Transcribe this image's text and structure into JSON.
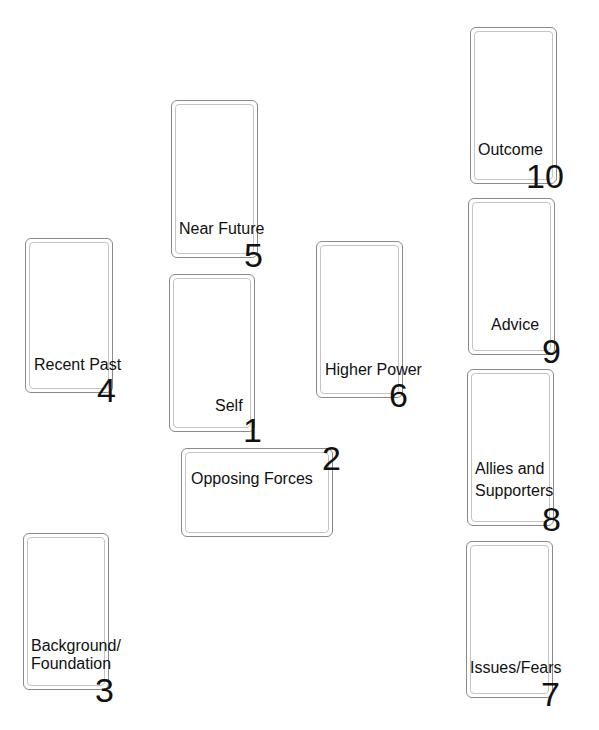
{
  "cards": [
    {
      "number": "1",
      "label": "Self"
    },
    {
      "number": "2",
      "label": "Opposing Forces"
    },
    {
      "number": "3",
      "label_line1": "Background/",
      "label_line2": "Foundation"
    },
    {
      "number": "4",
      "label": "Recent Past"
    },
    {
      "number": "5",
      "label": "Near Future"
    },
    {
      "number": "6",
      "label": "Higher Power"
    },
    {
      "number": "7",
      "label": "Issues/Fears"
    },
    {
      "number": "8",
      "label_line1": "Allies and",
      "label_line2": "Supporters"
    },
    {
      "number": "9",
      "label": "Advice"
    },
    {
      "number": "10",
      "label": "Outcome"
    }
  ],
  "colors": {
    "card_border": "#8a8a8a",
    "card_inner_border": "#c4c4c4",
    "text": "#111111",
    "background": "#ffffff"
  }
}
